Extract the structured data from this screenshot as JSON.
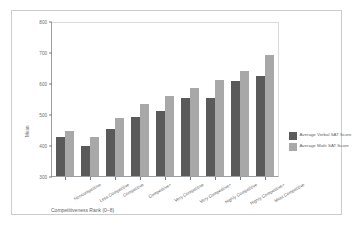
{
  "chart_data": {
    "type": "bar",
    "title": "",
    "xlabel": "Competitiveness Rank (0–8)",
    "ylabel": "Mean",
    "ylim": [
      300,
      800
    ],
    "yticks": [
      300,
      400,
      500,
      600,
      700,
      800
    ],
    "grid": false,
    "legend_position": "right",
    "categories": [
      "Noncompetitive",
      "Less Competitive",
      "Competitive",
      "Competitive+",
      "Very Competitive",
      "Very Competitive+",
      "Highly Competitive",
      "Highly Competitive+",
      "Most Competitive"
    ],
    "series": [
      {
        "name": "Average Verbal SAT Score",
        "color": "#5a5a5a",
        "values": [
          425,
          398,
          452,
          490,
          510,
          553,
          552,
          605,
          622
        ]
      },
      {
        "name": "Average Math SAT Score",
        "color": "#a8a8a8",
        "values": [
          445,
          425,
          487,
          533,
          557,
          585,
          611,
          640,
          690
        ]
      }
    ]
  },
  "axis": {
    "y_tick_labels": [
      "800",
      "700",
      "600",
      "500",
      "400",
      "300"
    ],
    "y_axis_title": "Mean",
    "x_axis_title": "Competitiveness Rank (0–8)"
  },
  "legend": {
    "items": [
      {
        "label": "Average Verbal SAT Score",
        "color": "#5a5a5a"
      },
      {
        "label": "Average Math SAT Score",
        "color": "#a8a8a8"
      }
    ]
  }
}
